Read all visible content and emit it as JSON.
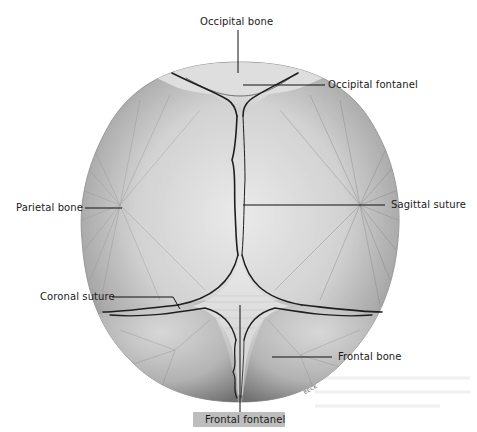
{
  "figure": {
    "signature": "BECK",
    "labels": [
      {
        "id": "occipital-bone",
        "text": "Occipital bone"
      },
      {
        "id": "occipital-fontanel",
        "text": "Occipital fontanel"
      },
      {
        "id": "parietal-bone",
        "text": "Parietal bone"
      },
      {
        "id": "sagittal-suture",
        "text": "Sagittal suture"
      },
      {
        "id": "coronal-suture",
        "text": "Coronal suture"
      },
      {
        "id": "frontal-bone",
        "text": "Frontal bone"
      },
      {
        "id": "frontal-fontanel",
        "text": "Frontal fontanel"
      }
    ]
  },
  "colors": {
    "background": "#ffffff",
    "bone_light": "#e4e4e4",
    "bone_mid": "#b8b8b8",
    "bone_dark": "#6e6e6e",
    "suture": "#1e1e1e",
    "leader_line": "#111111",
    "label_text": "#1a1a1a",
    "label_box": "#bdbdbd"
  }
}
